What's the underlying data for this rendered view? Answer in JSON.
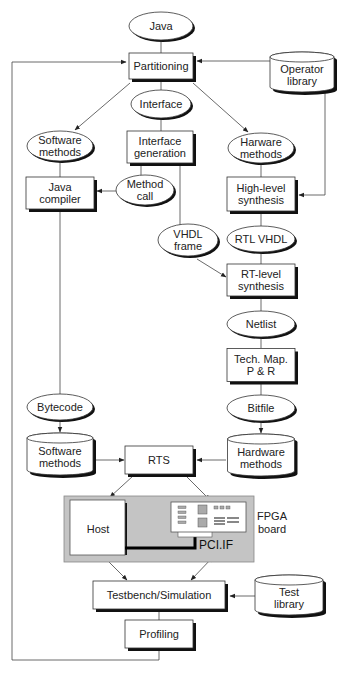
{
  "diagram": {
    "nodes": {
      "java": {
        "lines": [
          "Java"
        ],
        "shape": "ellipse"
      },
      "partitioning": {
        "lines": [
          "Partitioning"
        ],
        "shape": "box"
      },
      "operator_library": {
        "lines": [
          "Operator",
          "library"
        ],
        "shape": "cylinder"
      },
      "interface": {
        "lines": [
          "Interface"
        ],
        "shape": "ellipse"
      },
      "software_methods_data": {
        "lines": [
          "Software",
          "methods"
        ],
        "shape": "ellipse"
      },
      "interface_generation": {
        "lines": [
          "Interface",
          "generation"
        ],
        "shape": "box"
      },
      "harware_methods": {
        "lines": [
          "Harware",
          "methods"
        ],
        "shape": "ellipse"
      },
      "java_compiler": {
        "lines": [
          "Java",
          "compiler"
        ],
        "shape": "box"
      },
      "method_call": {
        "lines": [
          "Method",
          "call"
        ],
        "shape": "ellipse"
      },
      "high_level_synthesis": {
        "lines": [
          "High-level",
          "synthesis"
        ],
        "shape": "box"
      },
      "vhdl_frame": {
        "lines": [
          "VHDL",
          "frame"
        ],
        "shape": "ellipse"
      },
      "rtl_vhdl": {
        "lines": [
          "RTL VHDL"
        ],
        "shape": "ellipse"
      },
      "rt_level_synthesis": {
        "lines": [
          "RT-level",
          "synthesis"
        ],
        "shape": "box"
      },
      "netlist": {
        "lines": [
          "Netlist"
        ],
        "shape": "ellipse"
      },
      "tech_map": {
        "lines": [
          "Tech. Map.",
          "P & R"
        ],
        "shape": "box"
      },
      "bytecode": {
        "lines": [
          "Bytecode"
        ],
        "shape": "ellipse"
      },
      "bitfile": {
        "lines": [
          "Bitfile"
        ],
        "shape": "ellipse"
      },
      "software_methods_store": {
        "lines": [
          "Software",
          "methods"
        ],
        "shape": "cylinder"
      },
      "rts": {
        "lines": [
          "RTS"
        ],
        "shape": "box"
      },
      "hardware_methods_store": {
        "lines": [
          "Hardware",
          "methods"
        ],
        "shape": "cylinder"
      },
      "host": {
        "lines": [
          "Host"
        ],
        "shape": "box"
      },
      "pci_if": {
        "lines": [
          "PCI.IF"
        ],
        "shape": "label"
      },
      "fpga_board": {
        "lines": [
          "FPGA",
          "board"
        ],
        "shape": "label"
      },
      "testbench": {
        "lines": [
          "Testbench/Simulation"
        ],
        "shape": "box"
      },
      "test_library": {
        "lines": [
          "Test",
          "library"
        ],
        "shape": "cylinder"
      },
      "profiling": {
        "lines": [
          "Profiling"
        ],
        "shape": "box"
      }
    },
    "edges": [
      {
        "from": "java",
        "to": "partitioning",
        "arrow": false
      },
      {
        "from": "operator_library",
        "to": "partitioning",
        "arrow": true
      },
      {
        "from": "operator_library",
        "to": "high_level_synthesis",
        "arrow": true
      },
      {
        "from": "partitioning",
        "to": "interface",
        "arrow": false
      },
      {
        "from": "partitioning",
        "to": "software_methods_data",
        "arrow": true
      },
      {
        "from": "partitioning",
        "to": "harware_methods",
        "arrow": true
      },
      {
        "from": "interface",
        "to": "interface_generation",
        "arrow": false
      },
      {
        "from": "software_methods_data",
        "to": "java_compiler",
        "arrow": false
      },
      {
        "from": "interface_generation",
        "to": "method_call",
        "arrow": false
      },
      {
        "from": "interface_generation",
        "to": "vhdl_frame",
        "arrow": false
      },
      {
        "from": "method_call",
        "to": "java_compiler",
        "arrow": true
      },
      {
        "from": "harware_methods",
        "to": "high_level_synthesis",
        "arrow": false
      },
      {
        "from": "high_level_synthesis",
        "to": "rtl_vhdl",
        "arrow": false
      },
      {
        "from": "rtl_vhdl",
        "to": "rt_level_synthesis",
        "arrow": false
      },
      {
        "from": "vhdl_frame",
        "to": "rt_level_synthesis",
        "arrow": true
      },
      {
        "from": "rt_level_synthesis",
        "to": "netlist",
        "arrow": false
      },
      {
        "from": "netlist",
        "to": "tech_map",
        "arrow": false
      },
      {
        "from": "tech_map",
        "to": "bitfile",
        "arrow": false
      },
      {
        "from": "java_compiler",
        "to": "bytecode",
        "arrow": false
      },
      {
        "from": "bytecode",
        "to": "software_methods_store",
        "arrow": true
      },
      {
        "from": "bitfile",
        "to": "hardware_methods_store",
        "arrow": true
      },
      {
        "from": "software_methods_store",
        "to": "rts",
        "arrow": true
      },
      {
        "from": "hardware_methods_store",
        "to": "rts",
        "arrow": true
      },
      {
        "from": "rts",
        "to": "host",
        "arrow": true
      },
      {
        "from": "rts",
        "to": "fpga_card",
        "arrow": true
      },
      {
        "from": "host",
        "to": "testbench",
        "arrow": "both"
      },
      {
        "from": "pci_if",
        "to": "testbench",
        "arrow": "both"
      },
      {
        "from": "test_library",
        "to": "testbench",
        "arrow": true
      },
      {
        "from": "testbench",
        "to": "profiling",
        "arrow": false
      },
      {
        "from": "profiling",
        "to": "partitioning",
        "arrow": true,
        "note": "feedback loop"
      }
    ]
  }
}
